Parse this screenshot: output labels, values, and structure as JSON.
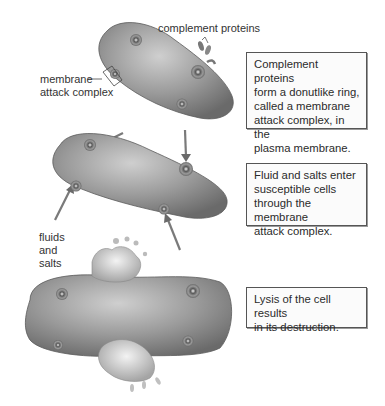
{
  "figure": {
    "labels": {
      "complement_proteins": "complement proteins",
      "membrane_attack_complex_line1": "membrane",
      "membrane_attack_complex_line2": "attack complex",
      "fluids_line1": "fluids",
      "fluids_line2": "and",
      "fluids_line3": "salts"
    },
    "steps": [
      {
        "lines": [
          "Complement proteins",
          "form a donutlike ring,",
          "called a membrane",
          "attack complex, in the",
          "plasma membrane."
        ]
      },
      {
        "lines": [
          "Fluid and salts enter",
          "susceptible cells",
          "through the membrane",
          "attack complex."
        ]
      },
      {
        "lines": [
          "Lysis of the cell results",
          "in its destruction."
        ]
      }
    ],
    "colors": {
      "cell_fill": "#8a8a8a",
      "cell_highlight": "#c8c8c8",
      "arrow": "#6e6e6e",
      "box_border": "#555555"
    }
  }
}
